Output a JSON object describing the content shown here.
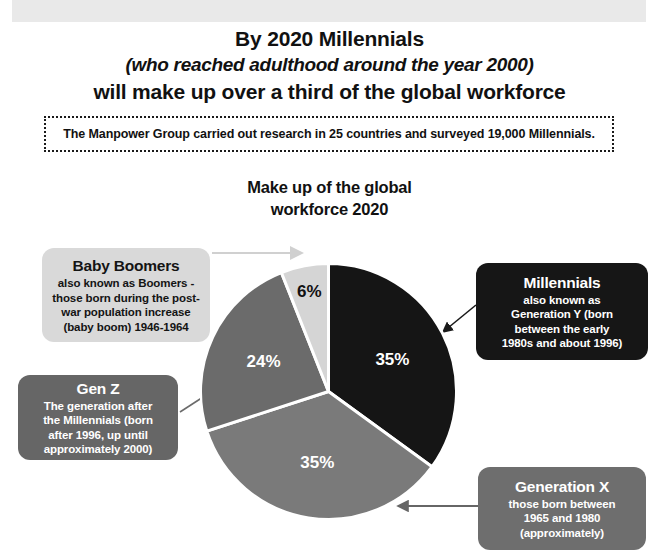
{
  "headline": {
    "line1": "By 2020 Millennials",
    "line2": "(who reached adulthood around the year 2000)",
    "line3": "will make up over a third of the global workforce"
  },
  "note": {
    "text": "The Manpower Group carried out research in 25 countries and surveyed 19,000 Millennials."
  },
  "chart_title": {
    "line1": "Make up of the global",
    "line2": "workforce 2020"
  },
  "callouts": {
    "boomers": {
      "title": "Baby Boomers",
      "line1": "also known as Boomers -",
      "line2": "those born during the post-",
      "line3": "war population increase",
      "line4": "(baby boom)  1946-1964"
    },
    "millennials": {
      "title": "Millennials",
      "line1": "also known as",
      "line2": "Generation Y (born",
      "line3": "between the early",
      "line4": "1980s and about 1996)"
    },
    "genz": {
      "title": "Gen Z",
      "line1": "The generation after",
      "line2": "the Millennials (born",
      "line3": "after 1996, up until",
      "line4": "approximately 2000)"
    },
    "genx": {
      "title": "Generation X",
      "line1": "those born between",
      "line2": "1965 and 1980",
      "line3": "(approximately)"
    }
  },
  "chart_data": {
    "type": "pie",
    "title": "Make up of the global workforce 2020",
    "categories": [
      "Millennials",
      "Generation X",
      "Gen Z",
      "Baby Boomers"
    ],
    "values": [
      35,
      35,
      24,
      6
    ],
    "labels": [
      "35%",
      "35%",
      "24%",
      "6%"
    ],
    "colors": [
      "#151515",
      "#7a7a7a",
      "#6b6b6b",
      "#d5d5d5"
    ],
    "label_colors": [
      "light",
      "light",
      "light",
      "dark"
    ],
    "start_angle_deg": 0,
    "direction": "clockwise",
    "legend": "none",
    "grid": false,
    "slice_separator_color": "#ffffff"
  },
  "labels": {
    "millennials_pct": "35%",
    "genx_pct": "35%",
    "genz_pct": "24%",
    "boomers_pct": "6%"
  }
}
